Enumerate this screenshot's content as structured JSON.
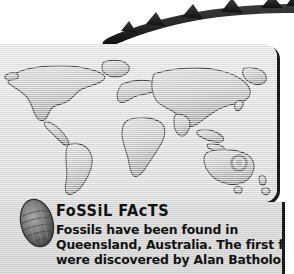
{
  "page": {
    "background_color": "#ffffff",
    "width": 294,
    "height": 274
  },
  "decor": {
    "dinosaur_tail": {
      "icon": "dinosaur-tail-silhouette",
      "description": "Spiked dinosaur tail curving from upper right to lower left",
      "color": "#262626",
      "spike_count": 5
    },
    "fossil_specimen": {
      "icon": "fossil-specimen-image",
      "description": "Oval fossilised shell specimen photograph",
      "color": "#6f6f6f"
    }
  },
  "map_panel": {
    "name": "world-map-panel",
    "background_color": "#e4e4e4",
    "shadow_color": "#1c1c1c",
    "map": {
      "icon": "world-map",
      "description": "Embossed grey world map",
      "land_color": "#cfcfcf",
      "outline_color": "#3a3a3a",
      "marker": {
        "icon": "location-marker",
        "label": "Queensland, Australia",
        "color": "#8c8c8c"
      }
    }
  },
  "fact_card": {
    "heading": "FoSSiL FAcTS",
    "body_lines": [
      "Fossils have been found in",
      "Queensland, Australia. The first fossils",
      "were discovered by Alan Batholomai"
    ],
    "background_color": "#d6d6d6",
    "text_color": "#121212",
    "rule_color": "#1c1c1c"
  }
}
